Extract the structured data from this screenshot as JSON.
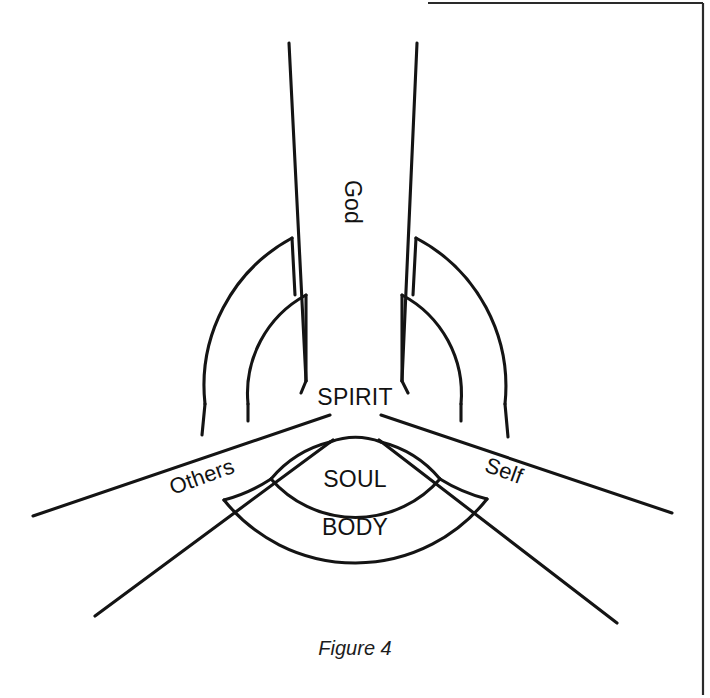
{
  "figure": {
    "caption": "Figure 4",
    "background_color": "#ffffff",
    "line_color": "#141414",
    "frame_color": "#2a2a2a"
  },
  "labels": {
    "god": "God",
    "spirit": "SPIRIT",
    "soul": "SOUL",
    "body": "BODY",
    "others": "Others",
    "self": "Self"
  },
  "diagram_data": {
    "type": "diagram",
    "description": "Three-axis relational diagram with concentric nested arcs radiating from a central SPIRIT core",
    "center": {
      "x": 355,
      "y": 400
    },
    "core_label": "SPIRIT",
    "axes": [
      {
        "name": "God",
        "direction": "up",
        "angle_deg": 90,
        "label_rotation_deg": 90
      },
      {
        "name": "Others",
        "direction": "lower-left",
        "angle_deg": 200,
        "label_rotation_deg": -20
      },
      {
        "name": "Self",
        "direction": "lower-right",
        "angle_deg": 340,
        "label_rotation_deg": 20
      }
    ],
    "concentric_rings": [
      {
        "name": "SPIRIT",
        "order": 0,
        "labeled": true
      },
      {
        "name": "SOUL",
        "order": 1,
        "labeled": true
      },
      {
        "name": "BODY",
        "order": 2,
        "labeled": true
      }
    ],
    "ring_sectors": {
      "upper_left": [
        "inner-arc",
        "outer-arc"
      ],
      "upper_right": [
        "inner-arc",
        "outer-arc"
      ],
      "bottom": [
        "SOUL",
        "BODY"
      ]
    }
  }
}
